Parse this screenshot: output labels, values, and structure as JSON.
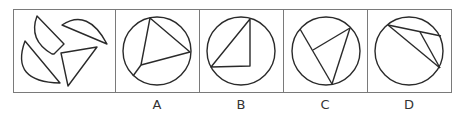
{
  "puzzle": {
    "question_panel": {
      "description": "Four separate shapes: two circular segments (semicircle-like), one triangle, one quadrilateral piece with arc"
    },
    "options": [
      {
        "label": "A",
        "description": "Circle with inscribed triangle whose vertices reach the circle, plus a line from one vertex to circumference"
      },
      {
        "label": "B",
        "description": "Circle with right triangle inside, hypotenuse as chord"
      },
      {
        "label": "C",
        "description": "Circle with chord and two lines forming a triangle touching circle"
      },
      {
        "label": "D",
        "description": "Circle with two chords from top-left plus short connecting line"
      }
    ],
    "colors": {
      "stroke": "#2a2a2a",
      "border": "#7a7a7a",
      "background": "#ffffff"
    }
  }
}
